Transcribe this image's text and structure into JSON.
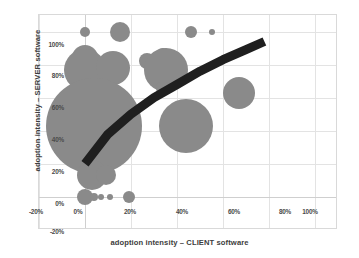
{
  "chart_data": {
    "type": "scatter",
    "variant": "bubble",
    "title": "",
    "xlabel": "adoption intensity – CLIENT software",
    "ylabel": "adoption intensity – SERVER software",
    "xlim": [
      -20,
      110
    ],
    "ylim": [
      -20,
      110
    ],
    "xticks": [
      -20,
      0,
      20,
      40,
      60,
      80,
      100
    ],
    "xticklabels": [
      "-20%",
      "0%",
      "20%",
      "40%",
      "60%",
      "80%",
      "100%"
    ],
    "yticks": [
      -20,
      0,
      20,
      40,
      60,
      80,
      100
    ],
    "yticklabels": [
      "-20%",
      "0%",
      "20%",
      "40%",
      "60%",
      "80%",
      "100%"
    ],
    "grid": true,
    "legend": "none",
    "bubble_color": "#8a8a8a",
    "trendline_color": "#1f1f1f",
    "grid_color": "#e3e3e3",
    "frame_color": "#d9d9d9",
    "points": [
      {
        "x": 0,
        "y": 100,
        "size": 5
      },
      {
        "x": 15,
        "y": 100,
        "size": 10
      },
      {
        "x": 46,
        "y": 100,
        "size": 6
      },
      {
        "x": 55,
        "y": 100,
        "size": 3
      },
      {
        "x": 0,
        "y": 84,
        "size": 13
      },
      {
        "x": 0,
        "y": 77,
        "size": 21
      },
      {
        "x": 12,
        "y": 78,
        "size": 17
      },
      {
        "x": 27,
        "y": 82,
        "size": 8
      },
      {
        "x": 34,
        "y": 85,
        "size": 8
      },
      {
        "x": 35,
        "y": 77,
        "size": 22
      },
      {
        "x": 34,
        "y": 66,
        "size": 7
      },
      {
        "x": 67,
        "y": 63,
        "size": 16
      },
      {
        "x": 4,
        "y": 43,
        "size": 48
      },
      {
        "x": 44,
        "y": 43,
        "size": 27
      },
      {
        "x": 3,
        "y": 13,
        "size": 15
      },
      {
        "x": 9,
        "y": 13,
        "size": 10
      },
      {
        "x": 0,
        "y": 0,
        "size": 8
      },
      {
        "x": 4,
        "y": 0,
        "size": 4
      },
      {
        "x": 7,
        "y": 0,
        "size": 3
      },
      {
        "x": 11,
        "y": 0,
        "size": 3
      },
      {
        "x": 19,
        "y": 0,
        "size": 6
      }
    ],
    "trendline": {
      "type": "logarithmic",
      "points": [
        [
          0,
          20
        ],
        [
          10,
          38
        ],
        [
          20,
          50
        ],
        [
          30,
          60
        ],
        [
          40,
          68
        ],
        [
          50,
          76
        ],
        [
          60,
          83
        ],
        [
          70,
          89
        ],
        [
          78,
          94
        ]
      ],
      "width": 9
    }
  },
  "axes": {
    "x_title": "adoption intensity – CLIENT software",
    "y_title": "adoption intensity – SERVER software",
    "x_tick_labels": [
      "-20%",
      "0%",
      "20%",
      "40%",
      "60%",
      "80%",
      "100%"
    ],
    "y_tick_labels": [
      "100%",
      "80%",
      "60%",
      "40%",
      "20%",
      "0%",
      "-20%"
    ]
  }
}
